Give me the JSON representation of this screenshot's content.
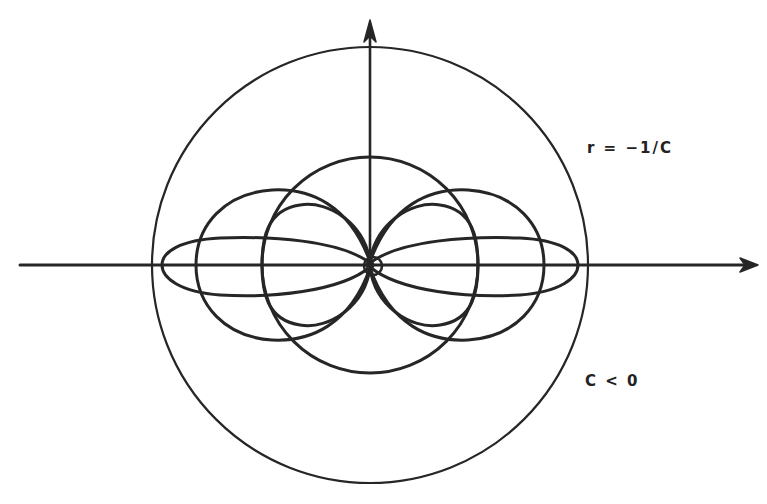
{
  "diagram": {
    "labels": {
      "radius": "r = −1/C",
      "condition": "C < 0"
    },
    "colors": {
      "stroke": "#262626",
      "background": "#ffffff"
    },
    "geometry": {
      "origin": [
        370,
        265
      ],
      "outer_circle_radius": 218,
      "inner_circle_radius": 108
    },
    "axes": {
      "x_axis": "horizontal-arrow-right",
      "y_axis": "vertical-arrow-up"
    }
  }
}
